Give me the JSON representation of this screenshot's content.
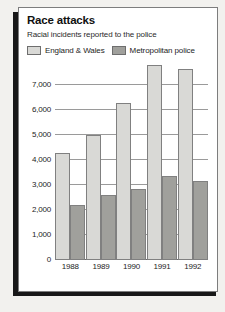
{
  "panel": {
    "title": "Race attacks",
    "subtitle": "Racial incidents reported to the police"
  },
  "legend": [
    {
      "label": "England & Wales",
      "color": "#d9d9d6"
    },
    {
      "label": "Metropolitan police",
      "color": "#a0a09c"
    }
  ],
  "axis": {
    "yticks": [
      "7,000",
      "6,000",
      "5,000",
      "4,000",
      "3,000",
      "2,000",
      "1,000",
      "0"
    ]
  },
  "chart_data": {
    "type": "bar",
    "title": "Race attacks",
    "subtitle": "Racial incidents reported to the police",
    "xlabel": "",
    "ylabel": "",
    "ylim": [
      0,
      8000
    ],
    "ytick_values": [
      7000,
      6000,
      5000,
      4000,
      3000,
      2000,
      1000,
      0
    ],
    "grid": true,
    "legend_position": "top-left",
    "categories": [
      "1988",
      "1989",
      "1990",
      "1991",
      "1992"
    ],
    "series": [
      {
        "name": "England & Wales",
        "color": "#d9d9d6",
        "values": [
          4300,
          5000,
          6300,
          7800,
          7650
        ]
      },
      {
        "name": "Metropolitan police",
        "color": "#a0a09c",
        "values": [
          2200,
          2600,
          2850,
          3350,
          3150
        ]
      }
    ]
  }
}
